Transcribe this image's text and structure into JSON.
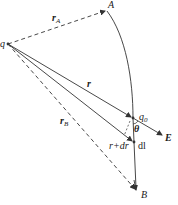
{
  "diagram": {
    "labels": {
      "q": "q",
      "A": "A",
      "B": "B",
      "rA_main": "r",
      "rA_sub": "A",
      "r": "r",
      "rB_main": "r",
      "rB_sub": "B",
      "q0_main": "q",
      "q0_sub": "0",
      "theta": "θ",
      "E": "E",
      "r_plus_dr": "r+dr",
      "dl": "dl"
    },
    "points": {
      "q": [
        8,
        44
      ],
      "A": [
        107,
        10
      ],
      "q0": [
        133,
        118
      ],
      "dl_end": [
        134,
        142
      ],
      "B": [
        137,
        190
      ],
      "E_tip": [
        163,
        135
      ]
    },
    "colors": {
      "line": "#333333",
      "text": "#1a1a1a"
    }
  }
}
